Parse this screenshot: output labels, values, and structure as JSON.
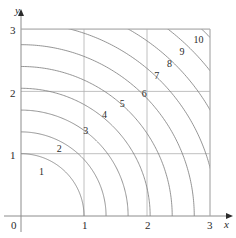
{
  "figure": {
    "kind": "contour-plot",
    "background": "#ffffff",
    "width": 236,
    "height": 238
  },
  "axes": {
    "x_title": "x",
    "y_title": "y",
    "origin_label": "0",
    "x_ticks": [
      {
        "label": "1",
        "value": 1
      },
      {
        "label": "2",
        "value": 2
      },
      {
        "label": "3",
        "value": 3
      }
    ],
    "y_ticks": [
      {
        "label": "1",
        "value": 1
      },
      {
        "label": "2",
        "value": 2
      },
      {
        "label": "3",
        "value": 3
      }
    ],
    "axis_color": "#8c8c8c",
    "grid_color": "#b0b0b0",
    "contour_color": "#7a7a7a"
  },
  "chart_data": {
    "type": "line",
    "subtype": "contour",
    "title": "",
    "xlabel": "x",
    "ylabel": "y",
    "xlim": [
      0,
      3
    ],
    "ylim": [
      0,
      3
    ],
    "xticks": [
      0,
      1,
      2,
      3
    ],
    "yticks": [
      0,
      1,
      2,
      3
    ],
    "grid": true,
    "legend": "none",
    "function": "f(x,y) = sqrt(x^2 + y^2) scaled; level curves are circular arcs centred at the origin",
    "level_label_count": 10,
    "levels": [
      {
        "label": "1",
        "value": 1,
        "radius": 1.0,
        "label_xy": [
          0.35,
          0.7
        ],
        "x_intercept": 1.0,
        "y_intercept": 1.0
      },
      {
        "label": "2",
        "value": 2,
        "radius": 1.35,
        "label_xy": [
          0.63,
          1.08
        ],
        "x_intercept": 1.35,
        "y_intercept": 1.35
      },
      {
        "label": "3",
        "value": 3,
        "radius": 1.7,
        "label_xy": [
          1.05,
          1.36
        ],
        "x_intercept": 1.7,
        "y_intercept": 1.7
      },
      {
        "label": "4",
        "value": 4,
        "radius": 2.05,
        "label_xy": [
          1.35,
          1.62
        ],
        "x_intercept": 2.05,
        "y_intercept": 2.05
      },
      {
        "label": "5",
        "value": 5,
        "radius": 2.4,
        "label_xy": [
          1.63,
          1.8
        ],
        "x_intercept": 2.4,
        "y_intercept": 2.4
      },
      {
        "label": "6",
        "value": 6,
        "radius": 2.75,
        "label_xy": [
          1.98,
          1.96
        ],
        "x_intercept": 2.75,
        "y_intercept": 2.75
      },
      {
        "label": "7",
        "value": 7,
        "radius": 3.1,
        "label_xy": [
          2.18,
          2.25
        ],
        "x_intercept": 3.1,
        "y_intercept": 3.1
      },
      {
        "label": "8",
        "value": 8,
        "radius": 3.45,
        "label_xy": [
          2.38,
          2.44
        ],
        "x_intercept": 3.45,
        "y_intercept": 3.45
      },
      {
        "label": "9",
        "value": 9,
        "radius": 3.8,
        "label_xy": [
          2.58,
          2.63
        ],
        "x_intercept": 3.8,
        "y_intercept": 3.8
      },
      {
        "label": "10",
        "value": 10,
        "radius": 4.15,
        "label_xy": [
          2.8,
          2.83
        ],
        "x_intercept": 4.15,
        "y_intercept": 4.15
      }
    ]
  }
}
